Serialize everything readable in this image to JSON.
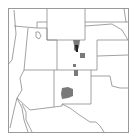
{
  "map": {
    "title": "Southwestern United States region map",
    "region": "Four Corners / Rocky Mountain region",
    "states_visible": [
      "Wyoming",
      "Colorado",
      "New Mexico",
      "Utah",
      "Arizona",
      "Nebraska",
      "Kansas",
      "Oklahoma",
      "Texas",
      "Nevada",
      "California",
      "Idaho",
      "South Dakota"
    ],
    "highlighted_states": [
      "Colorado",
      "New Mexico"
    ],
    "colors": {
      "background": "#ffffff",
      "border_line": "#8a8a8a",
      "frame": "#9a9a9a",
      "shaded_area": "#7a7a7a",
      "dark_area": "#222222"
    },
    "shaded_regions": [
      {
        "name": "north-central-colorado",
        "state": "Colorado"
      },
      {
        "name": "central-colorado-dark",
        "state": "Colorado"
      },
      {
        "name": "east-central-colorado",
        "state": "Colorado"
      },
      {
        "name": "south-colorado-small",
        "state": "Colorado"
      },
      {
        "name": "north-new-mexico",
        "state": "New Mexico"
      },
      {
        "name": "central-new-mexico",
        "state": "New Mexico"
      }
    ]
  }
}
